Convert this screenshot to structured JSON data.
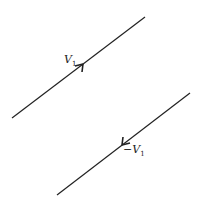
{
  "diagram": {
    "vectors": [
      {
        "name": "V",
        "subscript": "1",
        "sign": "",
        "direction": "up-right"
      },
      {
        "name": "V",
        "subscript": "1",
        "sign": "−",
        "direction": "down-left"
      }
    ],
    "colors": {
      "line": "#222222",
      "background": "#ffffff"
    }
  }
}
